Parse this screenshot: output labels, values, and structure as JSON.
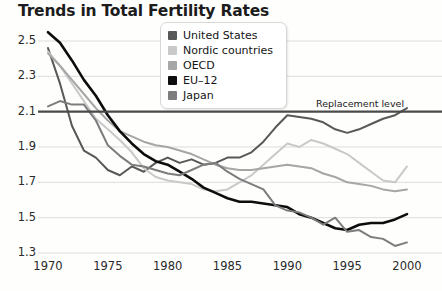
{
  "chart_data": {
    "type": "line",
    "title": "Trends in Total Fertility Rates",
    "xlabel": "",
    "ylabel": "",
    "xlim": [
      1970,
      2000
    ],
    "ylim": [
      1.25,
      2.58
    ],
    "yticks": [
      "2.5",
      "2.3",
      "2.1",
      "1.9",
      "1.7",
      "1.5",
      "1.3"
    ],
    "ytick_values": [
      2.5,
      2.3,
      2.1,
      1.9,
      1.7,
      1.5,
      1.3
    ],
    "xticks": [
      "1970",
      "1975",
      "1980",
      "1985",
      "1990",
      "1995",
      "2000"
    ],
    "xtick_values": [
      1970,
      1975,
      1980,
      1985,
      1990,
      1995,
      2000
    ],
    "grid": true,
    "legend_position": "top-center",
    "annotations": [
      {
        "text": "Replacement level",
        "y_value": 2.1,
        "x_value": 1992,
        "note": "horizontal reference line at 2.1"
      }
    ],
    "reference_line": {
      "label": "Replacement level",
      "value": 2.1,
      "color": "#4a4a4a"
    },
    "x": [
      1970,
      1971,
      1972,
      1973,
      1974,
      1975,
      1976,
      1977,
      1978,
      1979,
      1980,
      1981,
      1982,
      1983,
      1984,
      1985,
      1986,
      1987,
      1988,
      1989,
      1990,
      1991,
      1992,
      1993,
      1994,
      1995,
      1996,
      1997,
      1998,
      1999,
      2000
    ],
    "series": [
      {
        "name": "United States",
        "color": "#585858",
        "values": [
          2.46,
          2.26,
          2.02,
          1.88,
          1.84,
          1.77,
          1.74,
          1.79,
          1.76,
          1.81,
          1.84,
          1.81,
          1.83,
          1.8,
          1.81,
          1.84,
          1.84,
          1.87,
          1.93,
          2.01,
          2.08,
          2.07,
          2.06,
          2.04,
          2.0,
          1.98,
          2.0,
          2.03,
          2.06,
          2.08,
          2.12
        ]
      },
      {
        "name": "Nordic countries",
        "color": "#c9c9c9",
        "values": [
          2.44,
          2.36,
          2.26,
          2.16,
          2.06,
          2.0,
          1.94,
          1.87,
          1.78,
          1.73,
          1.71,
          1.7,
          1.69,
          1.66,
          1.65,
          1.66,
          1.7,
          1.74,
          1.8,
          1.86,
          1.92,
          1.9,
          1.94,
          1.92,
          1.89,
          1.86,
          1.81,
          1.76,
          1.71,
          1.7,
          1.79
        ]
      },
      {
        "name": "OECD",
        "color": "#a6a6a6",
        "values": [
          2.43,
          2.36,
          2.28,
          2.2,
          2.12,
          2.05,
          1.99,
          1.96,
          1.93,
          1.91,
          1.9,
          1.88,
          1.86,
          1.83,
          1.8,
          1.78,
          1.77,
          1.77,
          1.78,
          1.79,
          1.8,
          1.79,
          1.78,
          1.75,
          1.73,
          1.7,
          1.69,
          1.68,
          1.66,
          1.65,
          1.66
        ]
      },
      {
        "name": "EU–12",
        "color": "#0d0d0d",
        "values": [
          2.55,
          2.49,
          2.39,
          2.28,
          2.19,
          2.08,
          1.99,
          1.92,
          1.86,
          1.82,
          1.8,
          1.76,
          1.72,
          1.67,
          1.64,
          1.61,
          1.59,
          1.59,
          1.58,
          1.57,
          1.56,
          1.52,
          1.5,
          1.47,
          1.44,
          1.43,
          1.46,
          1.47,
          1.47,
          1.49,
          1.52
        ]
      },
      {
        "name": "Japan",
        "color": "#7d7d7d",
        "values": [
          2.13,
          2.16,
          2.14,
          2.14,
          2.05,
          1.91,
          1.85,
          1.8,
          1.79,
          1.77,
          1.75,
          1.74,
          1.77,
          1.8,
          1.81,
          1.76,
          1.72,
          1.69,
          1.66,
          1.57,
          1.54,
          1.53,
          1.5,
          1.46,
          1.5,
          1.42,
          1.43,
          1.39,
          1.38,
          1.34,
          1.36
        ]
      }
    ]
  },
  "legend": {
    "items": [
      {
        "label": "United States",
        "color": "#585858"
      },
      {
        "label": "Nordic countries",
        "color": "#c9c9c9"
      },
      {
        "label": "OECD",
        "color": "#a6a6a6"
      },
      {
        "label": "EU–12",
        "color": "#0d0d0d"
      },
      {
        "label": "Japan",
        "color": "#7d7d7d"
      }
    ]
  },
  "colors": {
    "background": "#fefefd",
    "grid": "#dcdcdc",
    "axis_text": "#2a2a2a",
    "title": "#1c1c1c",
    "replacement_line": "#4a4a4a"
  }
}
